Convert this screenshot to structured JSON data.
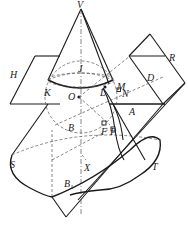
{
  "diagram": {
    "type": "geometry-figure",
    "labels": {
      "V": "V",
      "R": "R",
      "H": "H",
      "J": "J",
      "D": "D",
      "K": "K",
      "L": "L",
      "M": "M",
      "N": "N",
      "O": "O",
      "A": "A",
      "B": "B",
      "F": "F",
      "P": "P",
      "S": "S",
      "X": "X",
      "T": "T",
      "B1_main": "B",
      "B1_sub": "1"
    },
    "colors": {
      "stroke": "#1a1a1a",
      "dashed": "#555555",
      "background": "#ffffff"
    }
  }
}
